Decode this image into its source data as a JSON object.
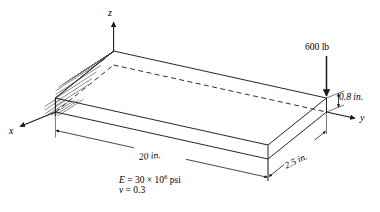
{
  "figure": {
    "kind": "cantilever-beam-isometric-diagram",
    "background_color": "#ffffff",
    "line_color": "#1a1a1a",
    "hatch_color": "#6b6b6b"
  },
  "axes": {
    "z_label": "z",
    "y_label": "y",
    "x_label": "x"
  },
  "load": {
    "label": "600 lb",
    "magnitude": 600,
    "unit": "lb",
    "direction": "downward",
    "applied_at": "free-end-far-corner"
  },
  "dimensions": {
    "length": {
      "label": "20 in.",
      "value": 20,
      "unit": "in."
    },
    "width": {
      "label": "2.5 in.",
      "value": 2.5,
      "unit": "in."
    },
    "thickness": {
      "label": "0.8 in.",
      "value": 0.8,
      "unit": "in."
    }
  },
  "material": {
    "modulus_var": "E",
    "modulus_eq": " = 30 × 10",
    "modulus_exp": "6",
    "modulus_unit": " psi",
    "poisson_var": "v",
    "poisson_eq": " = 0.3"
  },
  "support": {
    "type": "fixed-hatched-wall",
    "location": "left-end"
  }
}
